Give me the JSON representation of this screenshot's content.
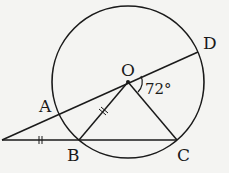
{
  "diagram": {
    "type": "circle-geometry",
    "colors": {
      "stroke": "#1a1a1a",
      "background": "#f4f4f2"
    },
    "circle": {
      "center": "O",
      "cx": 128,
      "cy": 82,
      "r": 76
    },
    "points": {
      "P": {
        "x": 2,
        "y": 140,
        "label": ""
      },
      "A": {
        "x": 60,
        "y": 113,
        "label": "A"
      },
      "O": {
        "x": 128,
        "y": 82,
        "label": "O"
      },
      "D": {
        "x": 198,
        "y": 52,
        "label": "D"
      },
      "B": {
        "x": 79,
        "y": 140,
        "label": "B"
      },
      "C": {
        "x": 177,
        "y": 140,
        "label": "C"
      }
    },
    "segments": [
      {
        "from": "P",
        "to": "D",
        "note": "secant through A and O"
      },
      {
        "from": "P",
        "to": "C",
        "note": "secant through B"
      },
      {
        "from": "O",
        "to": "B"
      },
      {
        "from": "O",
        "to": "C"
      }
    ],
    "angle": {
      "vertex": "O",
      "label": "72°",
      "between": [
        "D",
        "C"
      ]
    },
    "equal_marks": [
      {
        "segment": "PB",
        "mark": "||"
      },
      {
        "segment": "OB",
        "mark": "||"
      }
    ]
  }
}
